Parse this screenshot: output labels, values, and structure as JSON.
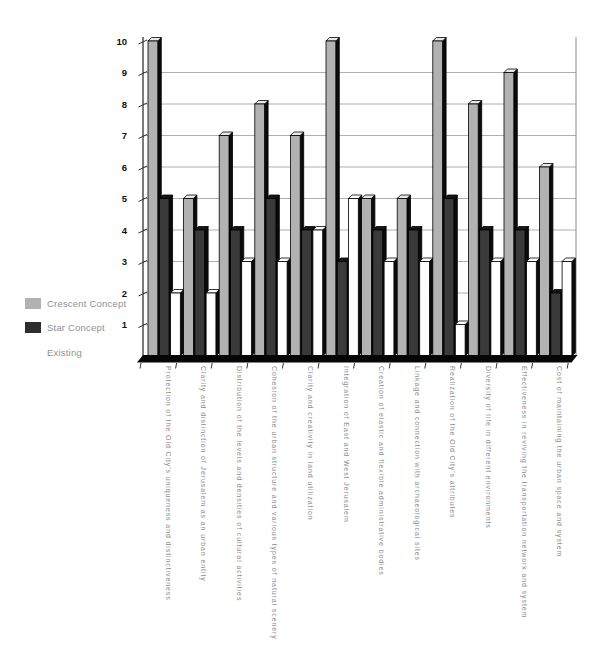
{
  "legend": {
    "items": [
      {
        "label": "Crescent Concept",
        "color": "#b2b2b2"
      },
      {
        "label": "Star Concept",
        "color": "#2e2e2e"
      },
      {
        "label": "Existing",
        "color": "#ffffff"
      }
    ]
  },
  "chart_data": {
    "type": "bar",
    "style": "3d-column-grouped",
    "title": "",
    "xlabel": "",
    "ylabel": "",
    "ylim": [
      0,
      10
    ],
    "grid": true,
    "legend_position": "left-middle",
    "y_ticks": [
      1,
      2,
      3,
      4,
      5,
      6,
      7,
      8,
      9,
      10
    ],
    "categories": [
      "Protection of the Old City's uniqueness and distinctiveness",
      "Clarity and distinction of Jerusalem as an urban entity",
      "Distribution of the levels and densities of cultural activities",
      "Cohesion of the urban structure and various types of natural scenery",
      "Clarity and creativity in land utilization",
      "Integration of East and West Jerusalem",
      "Creation of elastic and flexible administrative bodies",
      "Linkage and connection with archaeological sites",
      "Realization of the Old City's attributes",
      "Diversity of life in different environments",
      "Effectiveness in reviving the transportation network and system",
      "Cost of maintaining the urban space and system"
    ],
    "series": [
      {
        "name": "Crescent Concept",
        "color": "#b2b2b2",
        "top_color": "#e8e8e8",
        "values": [
          10,
          5,
          7,
          8,
          7,
          10,
          5,
          5,
          10,
          8,
          9,
          6
        ]
      },
      {
        "name": "Star Concept",
        "color": "#3a3a3a",
        "top_color": "#161616",
        "values": [
          5,
          4,
          4,
          5,
          4,
          3,
          4,
          4,
          5,
          4,
          4,
          2
        ]
      },
      {
        "name": "Existing",
        "color": "#ffffff",
        "top_color": "#ffffff",
        "values": [
          2,
          2,
          3,
          3,
          4,
          5,
          3,
          3,
          1,
          3,
          3,
          3
        ]
      }
    ]
  }
}
